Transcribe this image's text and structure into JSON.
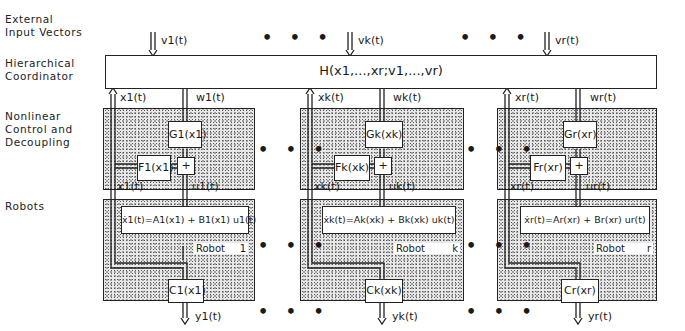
{
  "row_labels": {
    "external": [
      "External",
      "Input Vectors"
    ],
    "coordinator": [
      "Hierarchical",
      "Coordinator"
    ],
    "control": [
      "Nonlinear",
      "Control and",
      "Decoupling"
    ],
    "robots": "Robots"
  },
  "coordinator": {
    "function": "H(x1,...,xr;v1,...,vr)"
  },
  "ellipsis": "• • •",
  "columns": [
    {
      "index": "1",
      "input": "v1(t)",
      "state_up": "x1(t)",
      "w": "w1(t)",
      "G": "G1(x1)",
      "F": "F1(x1)",
      "sum": "+",
      "state_fb": "x1(t)",
      "u": "u1(t)",
      "dynamics": "ẋ1(t)=A1(x1) + B1(x1) u1(t)",
      "robot_label": "Robot",
      "robot_id": "1",
      "C": "C1(x1)",
      "output": "y1(t)"
    },
    {
      "index": "k",
      "input": "vk(t)",
      "state_up": "xk(t)",
      "w": "wk(t)",
      "G": "Gk(xk)",
      "F": "Fk(xk)",
      "sum": "+",
      "state_fb": "xk(t)",
      "u": "uk(t)",
      "dynamics": "ẋk(t)=Ak(xk) + Bk(xk) uk(t)",
      "robot_label": "Robot",
      "robot_id": "k",
      "C": "Ck(xk)",
      "output": "yk(t)"
    },
    {
      "index": "r",
      "input": "vr(t)",
      "state_up": "xr(t)",
      "w": "wr(t)",
      "G": "Gr(xr)",
      "F": "Fr(xr)",
      "sum": "+",
      "state_fb": "xr(t)",
      "u": "ur(t)",
      "dynamics": "ẋr(t)=Ar(xr) + Br(xr) ur(t)",
      "robot_label": "Robot",
      "robot_id": "r",
      "C": "Cr(xr)",
      "output": "yr(t)"
    }
  ]
}
